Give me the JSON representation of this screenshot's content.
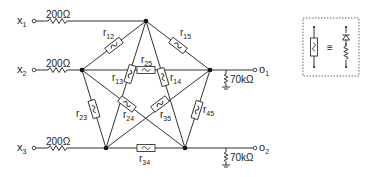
{
  "inputs": [
    {
      "label": "x",
      "sub": "1",
      "resistor": "200Ω"
    },
    {
      "label": "x",
      "sub": "2",
      "resistor": "200Ω"
    },
    {
      "label": "x",
      "sub": "3",
      "resistor": "200Ω"
    }
  ],
  "outputs": [
    {
      "label": "o",
      "sub": "1",
      "load": "70kΩ"
    },
    {
      "label": "o",
      "sub": "2",
      "load": "70kΩ"
    }
  ],
  "memristors": [
    {
      "id": "r12",
      "label": "r",
      "sub": "12"
    },
    {
      "id": "r15",
      "label": "r",
      "sub": "15"
    },
    {
      "id": "r25",
      "label": "r",
      "sub": "25"
    },
    {
      "id": "r13",
      "label": "r",
      "sub": "13"
    },
    {
      "id": "r14",
      "label": "r",
      "sub": "14"
    },
    {
      "id": "r23",
      "label": "r",
      "sub": "23"
    },
    {
      "id": "r24",
      "label": "r",
      "sub": "24"
    },
    {
      "id": "r35",
      "label": "r",
      "sub": "35"
    },
    {
      "id": "r45",
      "label": "r",
      "sub": "45"
    },
    {
      "id": "r34",
      "label": "r",
      "sub": "34"
    }
  ],
  "legend": {
    "equiv_symbol": "≡",
    "description": "memristor symbol equivalent to diode in series with resistor"
  }
}
